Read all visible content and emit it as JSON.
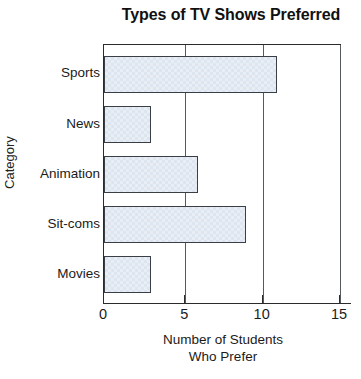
{
  "chart_data": {
    "type": "bar",
    "orientation": "horizontal",
    "title": "Types of TV Shows Preferred",
    "xlabel_line1": "Number of Students",
    "xlabel_line2": "Who Prefer",
    "ylabel": "Category",
    "categories": [
      "Sports",
      "News",
      "Animation",
      "Sit-coms",
      "Movies"
    ],
    "values": [
      11,
      3,
      6,
      9,
      3
    ],
    "xlim": [
      0,
      15
    ],
    "xticks": [
      0,
      5,
      10,
      15
    ],
    "xtick_labels": [
      "0",
      "5",
      "10",
      "15"
    ],
    "grid": "vertical-gridlines-at-xticks",
    "legend": "none",
    "bar_fill_color": "#dde5f0",
    "bar_border_color": "#3a3f45",
    "axis_color": "#2b2b2b",
    "gridline_color": "#555a5e",
    "background_color": "#ffffff"
  }
}
